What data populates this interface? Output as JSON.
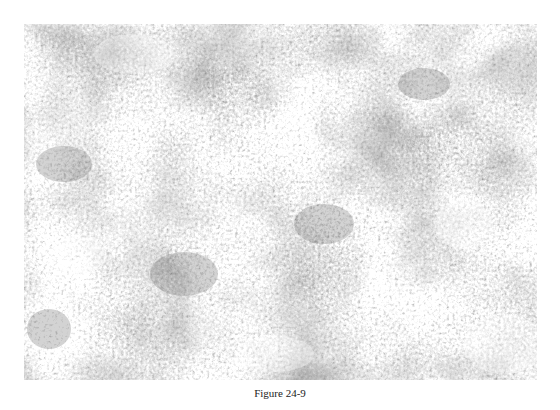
{
  "figure": {
    "caption": "Figure 24-9",
    "image": {
      "description": "grayscale micrograph texture",
      "colors": {
        "light": "#efefef",
        "mid": "#b5b5b5",
        "dark": "#6a6a6a"
      }
    }
  }
}
